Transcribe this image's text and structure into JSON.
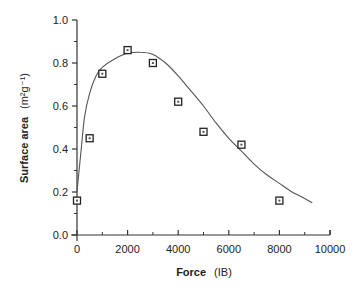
{
  "chart_data": {
    "type": "scatter",
    "title": "",
    "xlabel": "Force",
    "xlabel_unit": "(IB)",
    "ylabel": "Surface area",
    "ylabel_unit": "(m²g⁻¹)",
    "xlim": [
      0,
      10000
    ],
    "ylim": [
      0.0,
      1.0
    ],
    "x_ticks": [
      0,
      2000,
      4000,
      6000,
      8000,
      10000
    ],
    "x_tick_labels": [
      "0",
      "2000",
      "4000",
      "6000",
      "8000",
      "10000"
    ],
    "y_ticks": [
      0.0,
      0.2,
      0.4,
      0.6,
      0.8,
      1.0
    ],
    "y_tick_labels": [
      "0.0",
      "0.2",
      "0.4",
      "0.6",
      "0.8",
      "1.0"
    ],
    "grid": false,
    "legend": null,
    "series": [
      {
        "name": "measured",
        "kind": "scatter",
        "marker": "open-square",
        "x": [
          0,
          500,
          1000,
          2000,
          3000,
          4000,
          5000,
          6500,
          8000
        ],
        "y": [
          0.16,
          0.45,
          0.75,
          0.86,
          0.8,
          0.62,
          0.48,
          0.42,
          0.16
        ]
      },
      {
        "name": "fitted curve",
        "kind": "line",
        "x": [
          0,
          150,
          300,
          500,
          750,
          1000,
          1500,
          2000,
          2500,
          3000,
          3500,
          4000,
          4500,
          5000,
          5500,
          6000,
          6500,
          7000,
          7500,
          8000,
          8500,
          9000,
          9300
        ],
        "y": [
          0.2,
          0.38,
          0.55,
          0.66,
          0.74,
          0.78,
          0.82,
          0.845,
          0.85,
          0.84,
          0.8,
          0.74,
          0.67,
          0.6,
          0.52,
          0.45,
          0.39,
          0.33,
          0.28,
          0.24,
          0.2,
          0.17,
          0.15
        ]
      }
    ]
  }
}
